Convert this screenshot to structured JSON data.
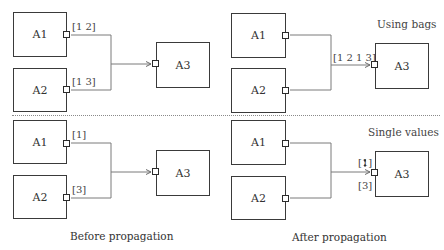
{
  "diagram": {
    "top_right_title": "Using bags",
    "bottom_right_title": "Single values",
    "captions": {
      "before": "Before propagation",
      "after": "After propagation"
    },
    "panels": {
      "top_left": {
        "blocks": [
          "A1",
          "A2",
          "A3"
        ],
        "port_labels": {
          "a1": "[1 2]",
          "a2": "[1 3]"
        }
      },
      "top_right": {
        "blocks": [
          "A1",
          "A2",
          "A3"
        ],
        "input_label": "[1 2 1 3]"
      },
      "bottom_left": {
        "blocks": [
          "A1",
          "A2",
          "A3"
        ],
        "port_labels": {
          "a1": "[1]",
          "a2": "[3]"
        }
      },
      "bottom_right": {
        "blocks": [
          "A1",
          "A2",
          "A3"
        ],
        "overwritten_value": {
          "open": "[",
          "value": "1",
          "close": "]"
        },
        "current_value": "[3]"
      }
    },
    "colors": {
      "block_border": "#3a3a3a",
      "wire": "#7a7a7a",
      "divider": "#8a8a8a"
    }
  }
}
